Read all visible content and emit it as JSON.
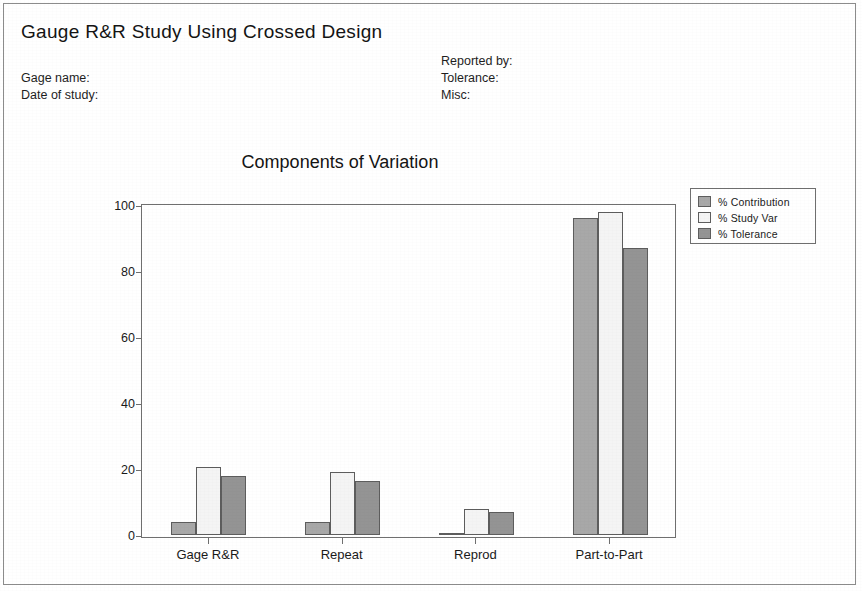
{
  "report": {
    "title": "Gauge R&R Study Using Crossed Design",
    "fields_left": [
      "Gage name:",
      "Date of study:"
    ],
    "fields_right": [
      "Reported by:",
      "Tolerance:",
      "Misc:"
    ]
  },
  "colors": {
    "series_contribution": "#a8a8a8",
    "series_study_var": "#f4f4f4",
    "series_tolerance": "#949494",
    "axis": "#6f6f6f",
    "border": "#8c8c8c",
    "text": "#1a1a1a"
  },
  "chart_data": {
    "type": "bar",
    "title": "Components of Variation",
    "xlabel": "",
    "ylabel": "",
    "categories": [
      "Gage R&R",
      "Repeat",
      "Reprod",
      "Part-to-Part"
    ],
    "series": [
      {
        "name": "% Contribution",
        "values": [
          4,
          4,
          0.7,
          96
        ]
      },
      {
        "name": "% Study Var",
        "values": [
          20.5,
          19,
          8,
          98
        ]
      },
      {
        "name": "% Tolerance",
        "values": [
          18,
          16.5,
          7,
          87
        ]
      }
    ],
    "ylim": [
      0,
      100
    ],
    "yticks": [
      0,
      20,
      40,
      60,
      80,
      100
    ],
    "ytick_labels": [
      "0",
      "20",
      "40",
      "60",
      "80",
      "100"
    ],
    "grid": false,
    "legend_position": "outside-top-right"
  }
}
